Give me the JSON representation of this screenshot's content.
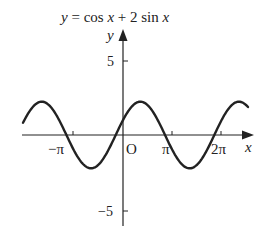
{
  "chart_data": {
    "type": "line",
    "title": "y = cos x + 2 sin x",
    "xlabel": "x",
    "ylabel": "y",
    "function": "cos(x) + 2*sin(x)",
    "x_ticks": [
      {
        "value": -3.14159,
        "label": "−π"
      },
      {
        "value": 3.14159,
        "label": "π"
      },
      {
        "value": 6.28319,
        "label": "2π"
      }
    ],
    "y_ticks": [
      {
        "value": 5,
        "label": "5"
      },
      {
        "value": -5,
        "label": "−5"
      }
    ],
    "origin_label": "O",
    "xlim": [
      -6.4,
      7.9
    ],
    "ylim": [
      -5.2,
      7.0
    ],
    "grid": false,
    "legend": null,
    "series": [
      {
        "name": "y = cos x + 2 sin x",
        "x": [
          -6.28,
          -5.5,
          -4.71,
          -3.93,
          -3.14,
          -2.36,
          -1.57,
          -0.79,
          0,
          0.79,
          1.57,
          2.36,
          3.14,
          3.93,
          4.71,
          5.5,
          6.28,
          7.07,
          7.85
        ],
        "y": [
          1.0,
          2.12,
          2.0,
          0.71,
          -1.0,
          -2.12,
          -2.0,
          -0.71,
          1.0,
          2.12,
          2.0,
          0.71,
          -1.0,
          -2.12,
          -2.0,
          -0.71,
          1.0,
          2.12,
          2.0
        ]
      }
    ]
  },
  "labels": {
    "title_lhs": "y",
    "title_eq": " = cos ",
    "title_x1": "x",
    "title_plus": " + 2 sin ",
    "title_x2": "x",
    "y_axis": "y",
    "x_axis": "x",
    "origin": "O",
    "tick_y_pos": "5",
    "tick_y_neg": "−5",
    "tick_x_negpi": "−π",
    "tick_x_pi": "π",
    "tick_x_2pi": "2π"
  }
}
